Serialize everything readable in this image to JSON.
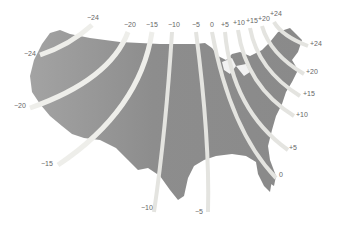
{
  "map": {
    "subject": "Magnetic declination isogonic lines over contiguous United States",
    "colors": {
      "land": "#8a8a8a",
      "land_west": "#9a9a9a",
      "band_light": "#f2f2ef",
      "band_shadow": "#9c9c96",
      "label": "#666666",
      "background": "#ffffff"
    },
    "labels": {
      "top": [
        {
          "id": "m24a",
          "text": "−24",
          "x": 87,
          "y": 18
        },
        {
          "id": "m20",
          "text": "−20",
          "x": 124,
          "y": 24
        },
        {
          "id": "m15",
          "text": "−15",
          "x": 146,
          "y": 24
        },
        {
          "id": "m10",
          "text": "−10",
          "x": 168,
          "y": 24
        },
        {
          "id": "m5",
          "text": "−5",
          "x": 192,
          "y": 24
        },
        {
          "id": "z0",
          "text": "0",
          "x": 210,
          "y": 24
        },
        {
          "id": "p5",
          "text": "+5",
          "x": 222,
          "y": 24
        },
        {
          "id": "p10",
          "text": "+10",
          "x": 233,
          "y": 22
        },
        {
          "id": "p15",
          "text": "+15",
          "x": 246,
          "y": 20
        },
        {
          "id": "p20",
          "text": "+20",
          "x": 258,
          "y": 18
        },
        {
          "id": "p24a",
          "text": "+24",
          "x": 270,
          "y": 13
        }
      ],
      "side": [
        {
          "id": "m24b",
          "text": "−24",
          "x": 24,
          "y": 51
        },
        {
          "id": "m20b",
          "text": "−20",
          "x": 15,
          "y": 103
        },
        {
          "id": "m15b",
          "text": "−15",
          "x": 41,
          "y": 161
        },
        {
          "id": "m10b",
          "text": "−10",
          "x": 141,
          "y": 205
        },
        {
          "id": "m5b",
          "text": "−5",
          "x": 195,
          "y": 208
        },
        {
          "id": "z0b",
          "text": "0",
          "x": 278,
          "y": 172
        },
        {
          "id": "p5b",
          "text": "+5",
          "x": 290,
          "y": 145
        },
        {
          "id": "p10b",
          "text": "+10",
          "x": 296,
          "y": 112
        },
        {
          "id": "p15b",
          "text": "+15",
          "x": 303,
          "y": 91
        },
        {
          "id": "p20b",
          "text": "+20",
          "x": 306,
          "y": 69
        },
        {
          "id": "p24b",
          "text": "+24",
          "x": 310,
          "y": 41
        }
      ]
    }
  }
}
